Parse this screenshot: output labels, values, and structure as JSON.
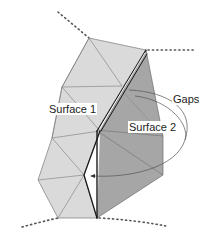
{
  "diagram": {
    "labels": {
      "surface1": "Surface 1",
      "surface2": "Surface 2",
      "gaps": "Gaps"
    },
    "colors": {
      "surface1_fill": "#dadada",
      "surface2_fill": "#a6a6a6",
      "edge": "#6e6e6e",
      "boundary": "#1a1a1a",
      "dotted": "#555555",
      "background": "#ffffff"
    }
  }
}
